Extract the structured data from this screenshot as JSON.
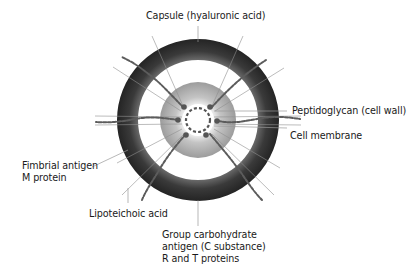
{
  "diagram": {
    "labels": {
      "capsule": "Capsule (hyaluronic acid)",
      "peptidoglycan": "Peptidoglycan (cell wall)",
      "membrane": "Cell membrane",
      "fimbrial_line1": "Fimbrial antigen",
      "fimbrial_line2": "M protein",
      "lipoteichoic": "Lipoteichoic acid",
      "group_line1": "Group carbohydrate",
      "group_line2": "antigen (C substance)",
      "group_line3": "R and T proteins"
    },
    "colors": {
      "capsule_ring_outer": "#2e2e2e",
      "capsule_ring_inner": "#5a5a5a",
      "wall_ring_outer": "#a8a8a8",
      "wall_ring_inner": "#e2e2e2",
      "fimbriae": "#555555",
      "leader_line": "#9a9a9a",
      "text": "#1a1a1a"
    },
    "geometry": {
      "center": [
        198,
        120
      ],
      "capsule_outer_r": 81,
      "capsule_inner_r": 60,
      "wall_outer_r": 38,
      "wall_inner_r": 16,
      "membrane_r": 12
    }
  }
}
